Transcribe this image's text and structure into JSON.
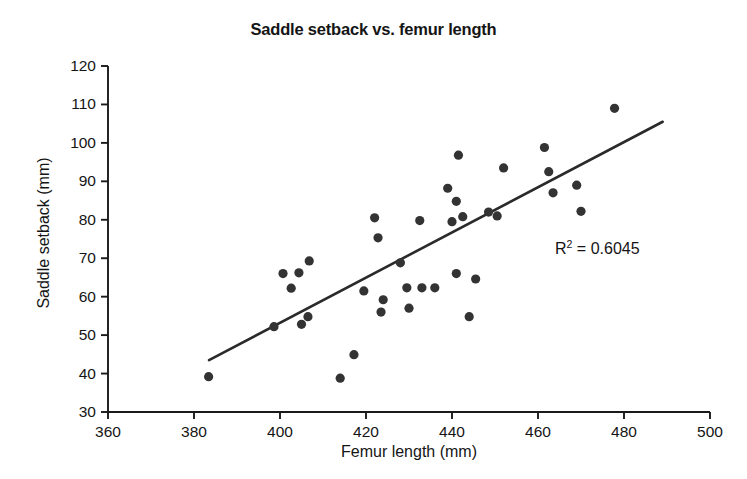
{
  "chart_data": {
    "type": "scatter",
    "title": "Saddle setback vs. femur length",
    "xlabel": "Femur length (mm)",
    "ylabel": "Saddle setback (mm)",
    "xlim": [
      360,
      500
    ],
    "ylim": [
      30,
      120
    ],
    "xticks": [
      360,
      380,
      400,
      420,
      440,
      460,
      480,
      500
    ],
    "yticks": [
      30,
      40,
      50,
      60,
      70,
      80,
      90,
      100,
      110,
      120
    ],
    "grid": false,
    "legend": false,
    "annotation": "R² = 0.6045",
    "annotation_text": "R",
    "annotation_sup": "2",
    "annotation_rest": " = 0.6045",
    "r_squared": 0.6045,
    "marker_color": "#333333",
    "trendline_color": "#2a2a2a",
    "axis_color": "#1a1a1a",
    "trendline": {
      "x": [
        383.5,
        489.0
      ],
      "y": [
        43.5,
        105.5
      ]
    },
    "points": [
      {
        "x": 383.4,
        "y": 39.2
      },
      {
        "x": 398.6,
        "y": 52.2
      },
      {
        "x": 400.7,
        "y": 66.0
      },
      {
        "x": 402.6,
        "y": 62.2
      },
      {
        "x": 404.4,
        "y": 66.2
      },
      {
        "x": 406.8,
        "y": 69.3
      },
      {
        "x": 406.5,
        "y": 54.8
      },
      {
        "x": 405.0,
        "y": 52.8
      },
      {
        "x": 414.0,
        "y": 38.8
      },
      {
        "x": 417.2,
        "y": 44.9
      },
      {
        "x": 419.5,
        "y": 61.5
      },
      {
        "x": 422.0,
        "y": 80.5
      },
      {
        "x": 422.8,
        "y": 75.3
      },
      {
        "x": 424.0,
        "y": 59.2
      },
      {
        "x": 423.5,
        "y": 56.0
      },
      {
        "x": 428.0,
        "y": 68.8
      },
      {
        "x": 429.5,
        "y": 62.3
      },
      {
        "x": 430.0,
        "y": 57.0
      },
      {
        "x": 432.5,
        "y": 79.8
      },
      {
        "x": 433.0,
        "y": 62.3
      },
      {
        "x": 436.0,
        "y": 62.3
      },
      {
        "x": 439.0,
        "y": 88.2
      },
      {
        "x": 440.0,
        "y": 79.5
      },
      {
        "x": 441.5,
        "y": 96.8
      },
      {
        "x": 441.0,
        "y": 84.8
      },
      {
        "x": 442.5,
        "y": 80.8
      },
      {
        "x": 441.0,
        "y": 66.0
      },
      {
        "x": 444.0,
        "y": 54.8
      },
      {
        "x": 445.5,
        "y": 64.6
      },
      {
        "x": 448.5,
        "y": 82.0
      },
      {
        "x": 450.5,
        "y": 81.0
      },
      {
        "x": 452.0,
        "y": 93.5
      },
      {
        "x": 461.5,
        "y": 98.8
      },
      {
        "x": 462.5,
        "y": 92.5
      },
      {
        "x": 463.5,
        "y": 87.0
      },
      {
        "x": 469.0,
        "y": 89.0
      },
      {
        "x": 470.0,
        "y": 82.2
      },
      {
        "x": 477.8,
        "y": 109.0
      }
    ]
  },
  "axes": {
    "y_tick_labels": [
      "120",
      "110",
      "100",
      "90",
      "80",
      "70",
      "60",
      "50",
      "40",
      "30"
    ],
    "x_tick_labels": [
      "360",
      "380",
      "400",
      "420",
      "440",
      "460",
      "480",
      "500"
    ]
  }
}
